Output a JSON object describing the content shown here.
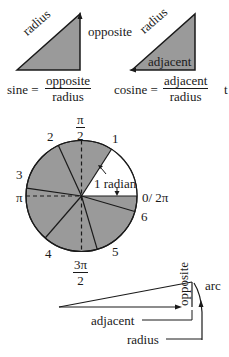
{
  "sine_triangle": {
    "hypotenuse_label": "radius",
    "side_label": "opposite",
    "formula_lhs": "sine =",
    "formula_num": "opposite",
    "formula_den": "radius"
  },
  "cosine_triangle": {
    "hypotenuse_label": "radius",
    "side_label": "adjacent",
    "formula_lhs": "cosine =",
    "formula_num": "adjacent",
    "formula_den": "radius"
  },
  "tangent_partial": {
    "text": "t"
  },
  "radian_circle": {
    "angle_labels": {
      "pi_over_2_num": "π",
      "pi_over_2_den": "2",
      "pi": "π",
      "three_pi_over_2_num": "3π",
      "three_pi_over_2_den": "2",
      "zero_two_pi": "0/ 2π"
    },
    "radian_markers": [
      "1",
      "2",
      "3",
      "4",
      "5",
      "6"
    ],
    "radian_annotation": "1 radian",
    "colors": {
      "shaded": "#9a9a9a",
      "unshaded": "#ffffff",
      "stroke": "#1a1a1a"
    }
  },
  "small_angle": {
    "side_opposite": "opposite",
    "side_adjacent": "adjacent",
    "side_radius": "radius",
    "arc_label": "arc"
  }
}
